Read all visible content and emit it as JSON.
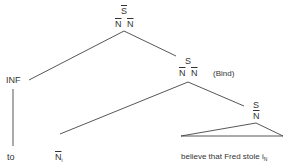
{
  "diagram": {
    "type": "syntax-tree",
    "nodes": {
      "root": {
        "label": "S",
        "bar": true,
        "features": [
          "N",
          "N"
        ]
      },
      "inf": {
        "label": "INF"
      },
      "s_mid": {
        "label": "S",
        "features": [
          "N",
          "N"
        ],
        "annotation": "(Bind)"
      },
      "s_low": {
        "label": "S",
        "features": [
          "N"
        ]
      }
    },
    "leaves": {
      "to": "to",
      "n_i": {
        "label": "N",
        "subscript": "i"
      },
      "clause": {
        "text": "believe that Fred stole i",
        "subscript": "N"
      }
    },
    "line_color": "#444444",
    "text_color": "#333333"
  }
}
